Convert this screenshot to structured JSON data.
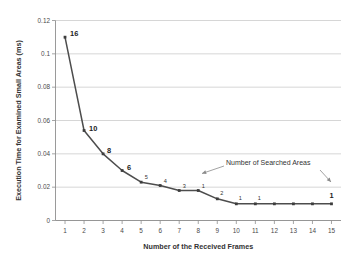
{
  "chart_data": {
    "type": "line",
    "title": "",
    "xlabel": "Number of the Received Frames",
    "ylabel": "Execution Time for Examined Small Areas  (ms)",
    "x": [
      1,
      2,
      3,
      4,
      5,
      6,
      7,
      8,
      9,
      10,
      11,
      12,
      13,
      14,
      15
    ],
    "values": [
      0.11,
      0.054,
      0.04,
      0.03,
      0.023,
      0.021,
      0.018,
      0.018,
      0.013,
      0.01,
      0.01,
      0.01,
      0.01,
      0.01,
      0.01
    ],
    "point_labels": [
      "16",
      "10",
      "8",
      "6",
      "5",
      "4",
      "3",
      "1",
      "2",
      "1",
      "1",
      "",
      "",
      "",
      "1"
    ],
    "point_label_emphasis": [
      true,
      true,
      true,
      true,
      false,
      false,
      false,
      false,
      false,
      false,
      false,
      false,
      false,
      false,
      true
    ],
    "xtick_labels": [
      "1",
      "2",
      "3",
      "4",
      "5",
      "6",
      "7",
      "8",
      "9",
      "10",
      "11",
      "12",
      "13",
      "14",
      "15"
    ],
    "ytick_labels": [
      "0",
      "0.02",
      "0.04",
      "0.06",
      "0.08",
      "0.1",
      "0.12"
    ],
    "ytick_values": [
      0,
      0.02,
      0.04,
      0.06,
      0.08,
      0.1,
      0.12
    ],
    "ylim": [
      0,
      0.12
    ],
    "xlim": [
      0.5,
      15.5
    ],
    "grid": "horizontal",
    "legend": "none",
    "annotations": [
      {
        "text": "Number of Searched Areas",
        "targets": [
          "point-8-label",
          "point-15-label"
        ]
      }
    ],
    "series_color": "#4d4d4d",
    "grid_color": "#c4c4c4",
    "text_color": "#333333",
    "background": "#ffffff"
  }
}
